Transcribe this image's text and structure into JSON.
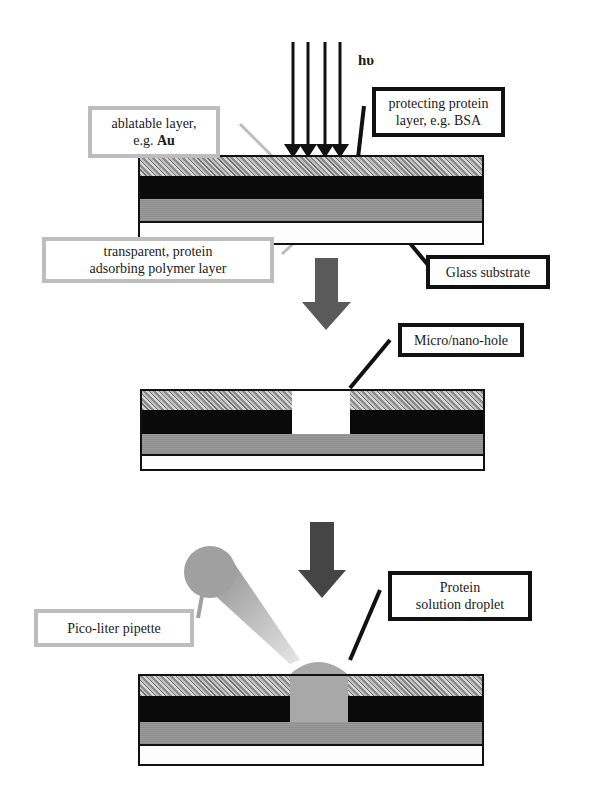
{
  "figure": {
    "light_label": "hυ",
    "labels": {
      "ablatable_line1": "ablatable layer,",
      "ablatable_line2_prefix": "e.g. ",
      "ablatable_line2_bold": "Au",
      "protecting_line1": "protecting protein",
      "protecting_line2": "layer, e.g. BSA",
      "transparent_line1": "transparent, protein",
      "transparent_line2": "adsorbing polymer layer",
      "glass": "Glass substrate",
      "hole": "Micro/nano-hole",
      "pipette": "Pico-liter pipette",
      "droplet_line1": "Protein",
      "droplet_line2": "solution droplet"
    },
    "layers": [
      {
        "name": "protecting protein layer",
        "color": "#b0b0b0"
      },
      {
        "name": "ablatable layer (Au)",
        "color": "#0a0a0a"
      },
      {
        "name": "transparent polymer layer",
        "color": "#959595"
      },
      {
        "name": "glass substrate",
        "color": "#fdfdfd"
      }
    ],
    "steps": [
      {
        "step": 1,
        "title": "Laser irradiation of layer stack"
      },
      {
        "step": 2,
        "title": "Micro/nano-hole after ablation"
      },
      {
        "step": 3,
        "title": "Protein droplet deposition via pipette"
      }
    ],
    "colors": {
      "arrow": "#5a5a5a",
      "droplet": "#a8a8a8",
      "pipette": "#9a9a9a",
      "outline_dark": "#111111",
      "outline_light": "#bdbdbd"
    }
  }
}
